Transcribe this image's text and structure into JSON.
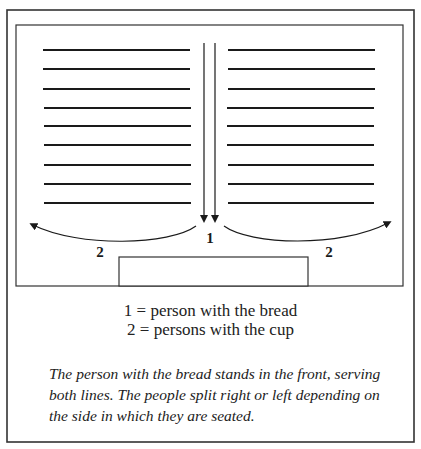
{
  "diagram": {
    "labels": {
      "center": "1",
      "left": "2",
      "right": "2"
    },
    "row_count_per_side": 9,
    "row_y": [
      50,
      69,
      89,
      108,
      126,
      145,
      165,
      184,
      203
    ],
    "left_rows_x": [
      43,
      190
    ],
    "right_rows_x": [
      228,
      375
    ],
    "colors": {
      "line": "#1a1a1a",
      "border": "#333333",
      "background": "#ffffff"
    }
  },
  "legend": {
    "items": [
      {
        "key": "1",
        "text": "1 = person with the bread"
      },
      {
        "key": "2",
        "text": "2 = persons with the cup"
      }
    ]
  },
  "caption": "The person with the bread stands in the front, serving both lines. The people split right or left depending on the side in which they are seated."
}
